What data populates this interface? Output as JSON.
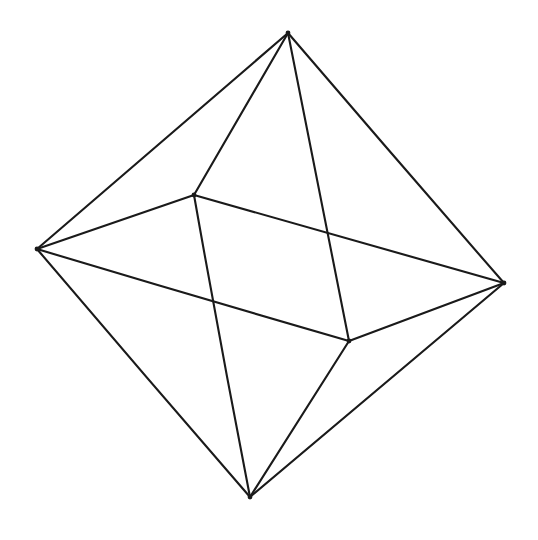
{
  "figure": {
    "shape_name": "octahedron",
    "background_color": "#ffffff",
    "line_color": "#1a1a1a",
    "line_width": 2.1,
    "canvas": {
      "width": 538,
      "height": 540
    },
    "vertex_count": 6,
    "edge_count": 12,
    "face_count": 8,
    "vertices": [
      {
        "id": "top",
        "label": "Top apex",
        "x": 288,
        "y": 33
      },
      {
        "id": "left",
        "label": "Left equatorial vertex",
        "x": 37,
        "y": 249
      },
      {
        "id": "right",
        "label": "Right equatorial vertex",
        "x": 504,
        "y": 283
      },
      {
        "id": "bottom",
        "label": "Bottom apex",
        "x": 250,
        "y": 497
      },
      {
        "id": "front",
        "label": "Front equatorial vertex",
        "x": 194,
        "y": 195
      },
      {
        "id": "back",
        "label": "Back equatorial vertex",
        "x": 349,
        "y": 341
      }
    ],
    "edges": [
      {
        "id": "top-left",
        "from": "top",
        "to": "left"
      },
      {
        "id": "top-right",
        "from": "top",
        "to": "right"
      },
      {
        "id": "top-front",
        "from": "top",
        "to": "front"
      },
      {
        "id": "top-back",
        "from": "top",
        "to": "back"
      },
      {
        "id": "bottom-left",
        "from": "bottom",
        "to": "left"
      },
      {
        "id": "bottom-right",
        "from": "bottom",
        "to": "right"
      },
      {
        "id": "bottom-front",
        "from": "bottom",
        "to": "front"
      },
      {
        "id": "bottom-back",
        "from": "bottom",
        "to": "back"
      },
      {
        "id": "left-front",
        "from": "left",
        "to": "front"
      },
      {
        "id": "left-back",
        "from": "left",
        "to": "back"
      },
      {
        "id": "right-front",
        "from": "right",
        "to": "front"
      },
      {
        "id": "right-back",
        "from": "right",
        "to": "back"
      }
    ]
  }
}
